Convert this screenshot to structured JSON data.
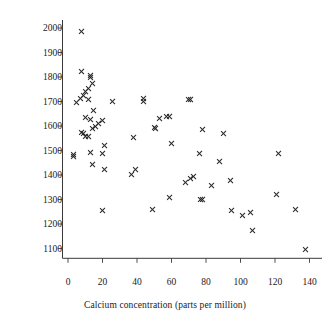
{
  "chart_data": {
    "type": "scatter",
    "title": "",
    "xlabel": "Calcium concentration (parts per million)",
    "ylabel": "Mortality rate (per 100 000)",
    "xlim": [
      0,
      145
    ],
    "ylim": [
      1060,
      2030
    ],
    "xticks": [
      0,
      20,
      40,
      60,
      80,
      100,
      120,
      140
    ],
    "yticks": [
      1100,
      1200,
      1300,
      1400,
      1500,
      1600,
      1700,
      1800,
      1900,
      2000
    ],
    "xtick_labels": [
      "0",
      "20",
      "40",
      "60",
      "80",
      "100",
      "120",
      "140"
    ],
    "ytick_labels": [
      "1100",
      "1200",
      "1300",
      "1400",
      "1500",
      "1600",
      "1700",
      "1800",
      "1900",
      "2000"
    ],
    "grid": false,
    "legend": null,
    "marker": "x",
    "marker_color": "#262626",
    "n_points": 61,
    "points": [
      {
        "x": 8,
        "y": 1987
      },
      {
        "x": 8,
        "y": 1823
      },
      {
        "x": 13,
        "y": 1807
      },
      {
        "x": 13,
        "y": 1800
      },
      {
        "x": 14,
        "y": 1772
      },
      {
        "x": 12,
        "y": 1755
      },
      {
        "x": 10,
        "y": 1742
      },
      {
        "x": 9,
        "y": 1724
      },
      {
        "x": 7,
        "y": 1714
      },
      {
        "x": 5,
        "y": 1696
      },
      {
        "x": 12,
        "y": 1709
      },
      {
        "x": 26,
        "y": 1701
      },
      {
        "x": 44,
        "y": 1713
      },
      {
        "x": 44,
        "y": 1702
      },
      {
        "x": 70,
        "y": 1709
      },
      {
        "x": 71,
        "y": 1709
      },
      {
        "x": 15,
        "y": 1665
      },
      {
        "x": 10,
        "y": 1636
      },
      {
        "x": 13,
        "y": 1627
      },
      {
        "x": 57,
        "y": 1640
      },
      {
        "x": 59,
        "y": 1637
      },
      {
        "x": 53,
        "y": 1631
      },
      {
        "x": 20,
        "y": 1623
      },
      {
        "x": 18,
        "y": 1609
      },
      {
        "x": 16,
        "y": 1596
      },
      {
        "x": 14,
        "y": 1591
      },
      {
        "x": 50,
        "y": 1594
      },
      {
        "x": 51,
        "y": 1591
      },
      {
        "x": 78,
        "y": 1587
      },
      {
        "x": 8,
        "y": 1574
      },
      {
        "x": 9,
        "y": 1569
      },
      {
        "x": 10,
        "y": 1559
      },
      {
        "x": 12,
        "y": 1558
      },
      {
        "x": 90,
        "y": 1569
      },
      {
        "x": 38,
        "y": 1554
      },
      {
        "x": 60,
        "y": 1527
      },
      {
        "x": 21,
        "y": 1519
      },
      {
        "x": 13,
        "y": 1491
      },
      {
        "x": 20,
        "y": 1487
      },
      {
        "x": 76,
        "y": 1486
      },
      {
        "x": 122,
        "y": 1486
      },
      {
        "x": 3,
        "y": 1485
      },
      {
        "x": 3,
        "y": 1475
      },
      {
        "x": 88,
        "y": 1456
      },
      {
        "x": 14,
        "y": 1441
      },
      {
        "x": 39,
        "y": 1423
      },
      {
        "x": 21,
        "y": 1424
      },
      {
        "x": 37,
        "y": 1404
      },
      {
        "x": 73,
        "y": 1392
      },
      {
        "x": 71,
        "y": 1386
      },
      {
        "x": 94,
        "y": 1378
      },
      {
        "x": 68,
        "y": 1369
      },
      {
        "x": 83,
        "y": 1359
      },
      {
        "x": 121,
        "y": 1320
      },
      {
        "x": 59,
        "y": 1309
      },
      {
        "x": 77,
        "y": 1302
      },
      {
        "x": 78,
        "y": 1300
      },
      {
        "x": 132,
        "y": 1260
      },
      {
        "x": 95,
        "y": 1254
      },
      {
        "x": 106,
        "y": 1247
      },
      {
        "x": 101,
        "y": 1236
      },
      {
        "x": 49,
        "y": 1259
      },
      {
        "x": 20,
        "y": 1257
      },
      {
        "x": 107,
        "y": 1175
      },
      {
        "x": 138,
        "y": 1096
      }
    ]
  }
}
